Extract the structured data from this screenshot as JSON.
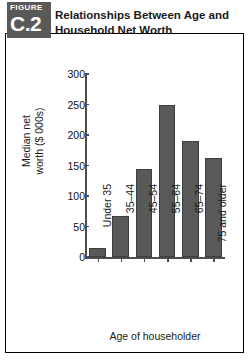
{
  "figure": {
    "badge_kicker": "FIGURE",
    "badge_number": "C.2",
    "title_line1": "Relationships Between Age and",
    "title_line2": "Household Net Worth"
  },
  "chart_data": {
    "type": "bar",
    "title": "Relationships Between Age and Household Net Worth",
    "xlabel": "Age of householder",
    "ylabel": "Median net worth ($ 000s)",
    "ylabel_line1": "Median net",
    "ylabel_line2": "worth ($ 000s)",
    "categories": [
      "Under 35",
      "35–44",
      "45–54",
      "55–64",
      "65–74",
      "75 and older"
    ],
    "values": [
      15,
      68,
      145,
      250,
      190,
      162
    ],
    "ylim": [
      0,
      300
    ],
    "yticks": [
      0,
      50,
      100,
      150,
      200,
      250,
      300
    ],
    "ytick_labels": [
      "0",
      "50",
      "100",
      "150",
      "200",
      "250",
      "300"
    ],
    "grid": false,
    "legend": null,
    "bar_color": "#595959",
    "bar_border_color": "#3d3d3d",
    "axis_color": "#4d4d4d"
  }
}
